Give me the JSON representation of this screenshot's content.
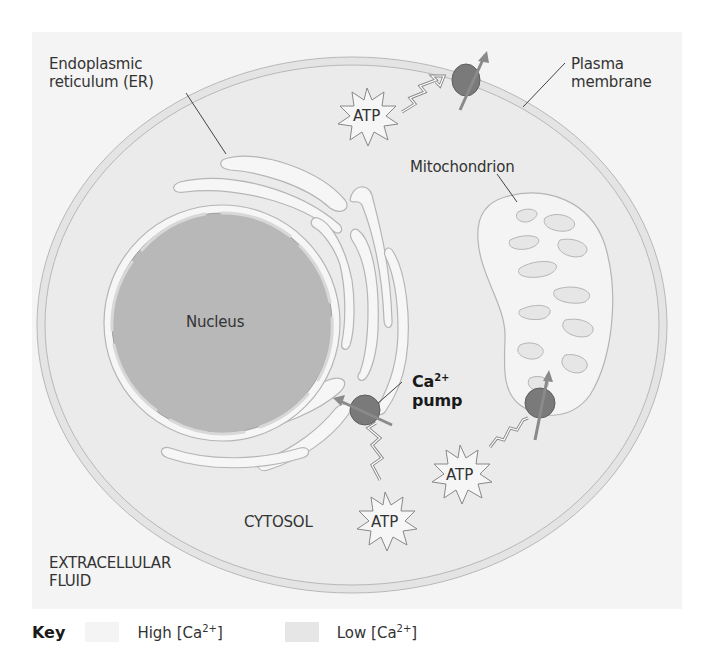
{
  "figure": {
    "colors": {
      "high_ca": "#f4f4f4",
      "low_ca": "#e6e6e6",
      "nucleus": "#b4b4b4",
      "pump": "#7a7a7a",
      "arrow": "#808080"
    }
  },
  "labels": {
    "er_line1": "Endoplasmic",
    "er_line2": "reticulum (ER)",
    "plasma_line1": "Plasma",
    "plasma_line2": "membrane",
    "mitochondrion": "Mitochondrion",
    "nucleus": "Nucleus",
    "ca_pump_ion": "Ca",
    "ca_pump_charge": "2+",
    "ca_pump_word": "pump",
    "cytosol": "CYTOSOL",
    "extracellular_line1": "EXTRACELLULAR",
    "extracellular_line2": "FLUID"
  },
  "atp": [
    {
      "label": "ATP",
      "location": "near plasma membrane pump"
    },
    {
      "label": "ATP",
      "location": "near mitochondrion pump"
    },
    {
      "label": "ATP",
      "location": "near ER pump"
    }
  ],
  "key": {
    "title": "Key",
    "items": [
      {
        "label_prefix": "High [Ca",
        "label_charge": "2+",
        "label_suffix": "]",
        "color": "#f4f4f4"
      },
      {
        "label_prefix": "Low [Ca",
        "label_charge": "2+",
        "label_suffix": "]",
        "color": "#e6e6e6"
      }
    ]
  }
}
